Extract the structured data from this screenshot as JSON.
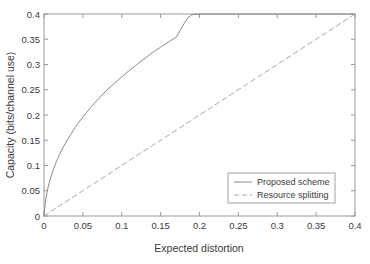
{
  "chart_data": {
    "type": "line",
    "title": "",
    "xlabel": "Expected distortion",
    "ylabel": "Capacity (bits/channel use)",
    "xlim": [
      0,
      0.4
    ],
    "ylim": [
      0,
      0.4
    ],
    "xticks": [
      0,
      0.05,
      0.1,
      0.15,
      0.2,
      0.25,
      0.3,
      0.35,
      0.4
    ],
    "yticks": [
      0,
      0.05,
      0.1,
      0.15,
      0.2,
      0.25,
      0.3,
      0.35,
      0.4
    ],
    "xtick_labels": [
      "0",
      "0.05",
      "0.1",
      "0.15",
      "0.2",
      "0.25",
      "0.3",
      "0.35",
      "0.4"
    ],
    "ytick_labels": [
      "0",
      "0.05",
      "0.1",
      "0.15",
      "0.2",
      "0.25",
      "0.3",
      "0.35",
      "0.4"
    ],
    "grid": false,
    "legend_position": "lower right",
    "series": [
      {
        "name": "Proposed scheme",
        "style": "solid",
        "color": "#8a8a8a",
        "x": [
          0.0,
          0.002,
          0.005,
          0.008,
          0.012,
          0.016,
          0.02,
          0.025,
          0.03,
          0.035,
          0.04,
          0.045,
          0.05,
          0.06,
          0.07,
          0.08,
          0.09,
          0.1,
          0.11,
          0.12,
          0.13,
          0.14,
          0.15,
          0.16,
          0.17,
          0.18,
          0.185,
          0.19,
          0.2,
          0.25,
          0.3,
          0.35,
          0.4
        ],
        "y": [
          0.0,
          0.031,
          0.055,
          0.073,
          0.092,
          0.108,
          0.122,
          0.137,
          0.151,
          0.163,
          0.175,
          0.186,
          0.196,
          0.215,
          0.232,
          0.248,
          0.262,
          0.2755,
          0.2885,
          0.3005,
          0.3125,
          0.324,
          0.3345,
          0.3445,
          0.354,
          0.3805,
          0.392,
          0.3985,
          0.4,
          0.4,
          0.4,
          0.4,
          0.4
        ]
      },
      {
        "name": "Resource splitting",
        "style": "dashed",
        "color": "#a8a8a8",
        "x": [
          0.0,
          0.4
        ],
        "y": [
          0.0,
          0.4
        ]
      }
    ],
    "legend_entries": [
      {
        "label": "Proposed scheme",
        "style": "solid"
      },
      {
        "label": "Resource splitting",
        "style": "dashed"
      }
    ]
  },
  "axes": {
    "x_title": "Expected distortion",
    "y_title": "Capacity (bits/channel use)",
    "xtick_labels": [
      "0",
      "0.05",
      "0.1",
      "0.15",
      "0.2",
      "0.25",
      "0.3",
      "0.35",
      "0.4"
    ],
    "ytick_labels": [
      "0",
      "0.05",
      "0.1",
      "0.15",
      "0.2",
      "0.25",
      "0.3",
      "0.35",
      "0.4"
    ]
  },
  "legend": {
    "item_0_label": "Proposed scheme",
    "item_1_label": "Resource splitting"
  },
  "colors": {
    "axis": "#9a9a9a",
    "curve_solid": "#8a8a8a",
    "curve_dashed": "#a8a8a8",
    "text": "#3a3a3a",
    "background": "#ffffff",
    "legend_border": "#a0a0a0"
  }
}
